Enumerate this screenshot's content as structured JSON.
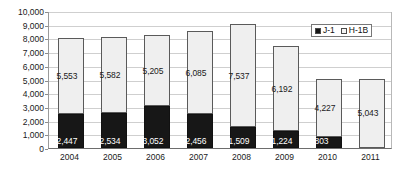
{
  "chart_data": {
    "type": "bar",
    "subtype": "stacked-column",
    "title": "",
    "xlabel": "",
    "ylabel": "",
    "categories": [
      "2004",
      "2005",
      "2006",
      "2007",
      "2008",
      "2009",
      "2010",
      "2011"
    ],
    "series": [
      {
        "name": "J-1",
        "color": "#171717",
        "values": [
          2447,
          2534,
          3052,
          2456,
          1509,
          1224,
          803,
          null
        ],
        "labels": [
          "2,447",
          "2,534",
          "3,052",
          "2,456",
          "1,509",
          "1,224",
          "803",
          ""
        ]
      },
      {
        "name": "H-1B",
        "color": "#efefef",
        "values": [
          5553,
          5582,
          5205,
          6085,
          7537,
          6192,
          4227,
          5043
        ],
        "labels": [
          "5,553",
          "5,582",
          "5,205",
          "6,085",
          "7,537",
          "6,192",
          "4,227",
          "5,043"
        ]
      }
    ],
    "totals": [
      8000,
      8116,
      8257,
      8541,
      9046,
      7416,
      5030,
      5043
    ],
    "ylim": [
      0,
      10000
    ],
    "ytick_step": 1000,
    "ytick_labels": [
      "10,000",
      "9,000",
      "8,000",
      "7,000",
      "6,000",
      "5,000",
      "4,000",
      "3,000",
      "2,000",
      "1,000",
      "0"
    ],
    "ytick_values": [
      10000,
      9000,
      8000,
      7000,
      6000,
      5000,
      4000,
      3000,
      2000,
      1000,
      0
    ],
    "grid": true,
    "legend_position": "top-right"
  },
  "legend": {
    "items": [
      {
        "label": "J-1",
        "swatch": "filled"
      },
      {
        "label": "H-1B",
        "swatch": "open"
      }
    ]
  }
}
